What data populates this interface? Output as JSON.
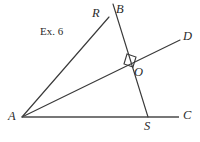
{
  "figure": {
    "caption": "Ex. 6",
    "background_color": "#ffffff",
    "stroke_color": "#3a3a3a",
    "points": {
      "A": "A",
      "B": "B",
      "C": "C",
      "D": "D",
      "O": "O",
      "R": "R",
      "S": "S"
    },
    "markers": {
      "right_angle_at": "O"
    },
    "segments": [
      {
        "name": "A-R",
        "from": "A",
        "to": "R"
      },
      {
        "name": "A-D",
        "from": "A",
        "to": "D"
      },
      {
        "name": "A-C",
        "from": "A",
        "to": "C"
      },
      {
        "name": "B-S",
        "from": "B",
        "to": "S"
      }
    ]
  }
}
